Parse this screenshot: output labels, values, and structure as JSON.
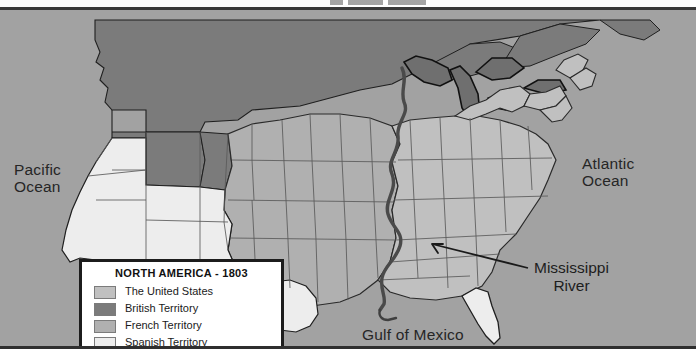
{
  "map": {
    "labels": {
      "pacific_line1": "Pacific",
      "pacific_line2": "Ocean",
      "atlantic_line1": "Atlantic",
      "atlantic_line2": "Ocean",
      "gulf": "Gulf of Mexico",
      "river_line1": "Mississippi",
      "river_line2": "River"
    },
    "ocean_color": "#a2a2a2",
    "border_color": "#2f2f2f"
  },
  "legend": {
    "title": "NORTH AMERICA - 1803",
    "items": [
      {
        "label": "The United States",
        "color": "#c0c0c0"
      },
      {
        "label": "British Territory",
        "color": "#7b7b7b"
      },
      {
        "label": "French Territory",
        "color": "#b0b0b0"
      },
      {
        "label": "Spanish Territory",
        "color": "#ededed"
      }
    ]
  }
}
